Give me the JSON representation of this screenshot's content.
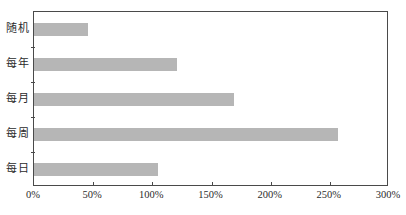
{
  "chart_data": {
    "type": "bar",
    "orientation": "horizontal",
    "title": "",
    "subtitle": "",
    "xlabel": "",
    "ylabel": "",
    "categories": [
      "随机",
      "每年",
      "每月",
      "每周",
      "每日"
    ],
    "values": [
      46,
      121,
      169,
      257,
      105
    ],
    "series": [
      {
        "name": "",
        "values": [
          46,
          121,
          169,
          257,
          105
        ]
      }
    ],
    "xlim": [
      0,
      300
    ],
    "xticks": [
      0,
      50,
      100,
      150,
      200,
      250,
      300
    ],
    "xtick_labels": [
      "0%",
      "50%",
      "100%",
      "150%",
      "200%",
      "250%",
      "300%"
    ],
    "value_format": "percent",
    "grid": false,
    "legend": false,
    "legend_position": "none",
    "bar_color": "#b6b6b6",
    "frame_color": "#4a4a4a",
    "background": "#ffffff"
  }
}
